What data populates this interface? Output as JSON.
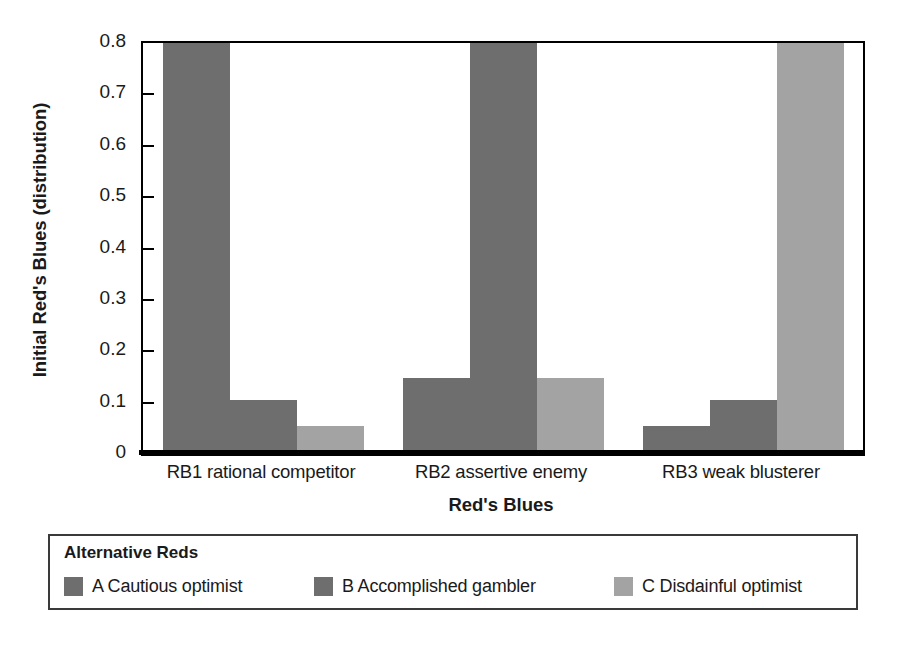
{
  "chart_data": {
    "type": "bar",
    "title": "",
    "subtitle": "",
    "xlabel": "Red's Blues",
    "ylabel": "Initial Red's Blues (distribution)",
    "categories": [
      "RB1 rational competitor",
      "RB2 assertive enemy",
      "RB3 weak blusterer"
    ],
    "series": [
      {
        "name": "A Cautious optimist",
        "values": [
          0.8,
          0.148,
          0.055
        ],
        "color": "#6e6e6e"
      },
      {
        "name": "B Accomplished gambler",
        "values": [
          0.105,
          0.8,
          0.105
        ],
        "color": "#6e6e6e"
      },
      {
        "name": "C Disdainful optimist",
        "values": [
          0.055,
          0.148,
          0.8
        ],
        "color": "#a3a3a3"
      }
    ],
    "ylim": [
      0,
      0.8
    ],
    "ytick_values": [
      0,
      0.1,
      0.2,
      0.3,
      0.4,
      0.5,
      0.6,
      0.7,
      0.8
    ],
    "ytick_labels": [
      "0",
      "0.1",
      "0.2",
      "0.3",
      "0.4",
      "0.5",
      "0.6",
      "0.7",
      "0.8"
    ],
    "grid": false,
    "legend_position": "below",
    "legend_title": "Alternative Reds",
    "note": "Bars reaching 0.8 are clipped at the top of the plot frame."
  },
  "axes": {
    "y_title": "Initial Red's Blues (distribution)",
    "x_title": "Red's Blues",
    "y_ticks": [
      {
        "label": "0.8",
        "value": 0.8
      },
      {
        "label": "0.7",
        "value": 0.7
      },
      {
        "label": "0.6",
        "value": 0.6
      },
      {
        "label": "0.5",
        "value": 0.5
      },
      {
        "label": "0.4",
        "value": 0.4
      },
      {
        "label": "0.3",
        "value": 0.3
      },
      {
        "label": "0.2",
        "value": 0.2
      },
      {
        "label": "0.1",
        "value": 0.1
      },
      {
        "label": "0",
        "value": 0
      }
    ],
    "x_categories": [
      {
        "label": "RB1 rational competitor"
      },
      {
        "label": "RB2 assertive enemy"
      },
      {
        "label": "RB3 weak blusterer"
      }
    ]
  },
  "legend": {
    "title": "Alternative Reds",
    "entries": [
      {
        "label": "A Cautious optimist",
        "color": "#6e6e6e"
      },
      {
        "label": "B Accomplished gambler",
        "color": "#6e6e6e"
      },
      {
        "label": "C Disdainful optimist",
        "color": "#a3a3a3"
      }
    ]
  },
  "colors": {
    "bar_dark": "#6e6e6e",
    "bar_light": "#a3a3a3",
    "axis": "#000000",
    "legend_border": "#3a3a3a",
    "background": "#ffffff"
  }
}
